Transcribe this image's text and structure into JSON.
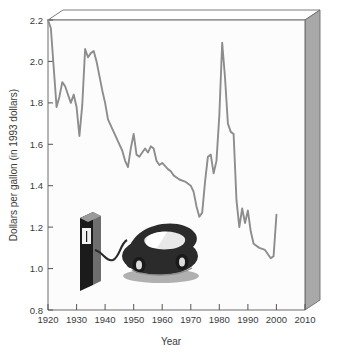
{
  "chart_data": {
    "type": "line",
    "title": "",
    "xlabel": "Year",
    "ylabel": "Dollars per gallon (in 1993 dollars)",
    "xlim": [
      1920,
      2010
    ],
    "ylim": [
      0.8,
      2.2
    ],
    "xticks": [
      1920,
      1930,
      1940,
      1950,
      1960,
      1970,
      1980,
      1990,
      2000,
      2010
    ],
    "yticks": [
      "0.8",
      "1.0",
      "1.2",
      "1.4",
      "1.6",
      "1.8",
      "2.0",
      "2.2"
    ],
    "grid": false,
    "legend": "none",
    "series": [
      {
        "name": "Gasoline price",
        "color": "#8d8d8d",
        "x": [
          1920,
          1921,
          1922,
          1923,
          1924,
          1925,
          1926,
          1927,
          1928,
          1929,
          1930,
          1931,
          1932,
          1933,
          1934,
          1935,
          1936,
          1937,
          1938,
          1939,
          1940,
          1941,
          1942,
          1943,
          1944,
          1945,
          1946,
          1947,
          1948,
          1949,
          1950,
          1951,
          1952,
          1953,
          1954,
          1955,
          1956,
          1957,
          1958,
          1959,
          1960,
          1961,
          1962,
          1963,
          1964,
          1965,
          1966,
          1967,
          1968,
          1969,
          1970,
          1971,
          1972,
          1973,
          1974,
          1975,
          1976,
          1977,
          1978,
          1979,
          1980,
          1981,
          1982,
          1983,
          1984,
          1985,
          1986,
          1987,
          1988,
          1989,
          1990,
          1991,
          1992,
          1993,
          1994,
          1995,
          1996,
          1997,
          1998,
          1999,
          2000
        ],
        "values": [
          2.18,
          2.16,
          1.92,
          1.79,
          1.87,
          1.9,
          1.84,
          1.8,
          1.81,
          1.77,
          1.72,
          1.64,
          1.83,
          1.8,
          1.73,
          1.77,
          1.73,
          1.66,
          1.74,
          1.65,
          1.91,
          2.03,
          2.0,
          2.06,
          2.04,
          2.05,
          2.03,
          1.97,
          1.93,
          1.88,
          1.84,
          1.79,
          1.74,
          1.7,
          1.66,
          1.62,
          1.58,
          1.53,
          1.49,
          1.56,
          1.65,
          1.58,
          1.56,
          1.55,
          1.57,
          1.57,
          1.59,
          1.6,
          1.6,
          1.59,
          1.56,
          1.53,
          1.51,
          1.51,
          1.56,
          1.55,
          1.51,
          1.48,
          1.46,
          1.45,
          1.47,
          1.45,
          1.42,
          1.4,
          1.41,
          1.4,
          1.35,
          1.3,
          1.25,
          1.27,
          1.34,
          1.36,
          1.4,
          1.5,
          1.54,
          1.54,
          1.52,
          1.5,
          1.48,
          1.46,
          1.47
        ],
        "note": "Visually traced from the rendered line; 1981 peak ≈ 2.09, 1998 trough ≈ 1.05, ends ≈ 1.26 near 2000"
      }
    ],
    "traced_points": {
      "x": [
        1920,
        1921,
        1923,
        1924,
        1925,
        1926,
        1928,
        1929,
        1930,
        1931,
        1932,
        1933,
        1934,
        1935,
        1936,
        1937,
        1938,
        1939,
        1940,
        1941,
        1943,
        1945,
        1946,
        1947,
        1948,
        1949,
        1950,
        1951,
        1952,
        1953,
        1954,
        1955,
        1956,
        1957,
        1958,
        1959,
        1960,
        1962,
        1963,
        1964,
        1965,
        1966,
        1968,
        1970,
        1971,
        1972,
        1973,
        1974,
        1975,
        1976,
        1977,
        1978,
        1979,
        1980,
        1981,
        1982,
        1983,
        1984,
        1985,
        1986,
        1987,
        1988,
        1989,
        1990,
        1991,
        1992,
        1994,
        1996,
        1998,
        1999,
        2000
      ],
      "y": [
        2.2,
        2.16,
        1.78,
        1.83,
        1.9,
        1.88,
        1.8,
        1.84,
        1.78,
        1.64,
        1.79,
        2.06,
        2.02,
        2.04,
        2.05,
        2.0,
        1.93,
        1.86,
        1.8,
        1.72,
        1.66,
        1.6,
        1.57,
        1.52,
        1.49,
        1.58,
        1.65,
        1.55,
        1.54,
        1.56,
        1.58,
        1.56,
        1.59,
        1.58,
        1.52,
        1.5,
        1.51,
        1.48,
        1.47,
        1.45,
        1.44,
        1.43,
        1.42,
        1.4,
        1.37,
        1.3,
        1.25,
        1.27,
        1.42,
        1.54,
        1.55,
        1.46,
        1.52,
        1.74,
        2.09,
        1.92,
        1.7,
        1.66,
        1.65,
        1.33,
        1.2,
        1.29,
        1.22,
        1.28,
        1.18,
        1.12,
        1.1,
        1.09,
        1.05,
        1.06,
        1.26
      ]
    }
  },
  "illustration": {
    "pump": "gas-pump",
    "vehicle": "car",
    "hose": "fuel-hose"
  },
  "frame": {
    "panel_color": "#a8a8a8",
    "top_color": "#ffffff",
    "axis_color": "#555555",
    "plot_background": "#fcfcfc"
  }
}
